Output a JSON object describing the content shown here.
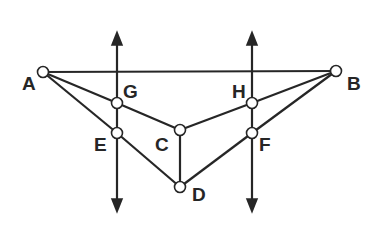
{
  "diagram": {
    "title": "",
    "colors": {
      "line": "#262626",
      "point_fill": "#ffffff",
      "background": "#ffffff"
    },
    "points": {
      "A": {
        "label": "A",
        "x": 43,
        "y": 72,
        "lx": 22,
        "ly": 90
      },
      "B": {
        "label": "B",
        "x": 336,
        "y": 71,
        "lx": 347,
        "ly": 90
      },
      "G": {
        "label": "G",
        "x": 117,
        "y": 103,
        "lx": 123,
        "ly": 98
      },
      "E": {
        "label": "E",
        "x": 117,
        "y": 133,
        "lx": 94,
        "ly": 151
      },
      "C": {
        "label": "C",
        "x": 180,
        "y": 130,
        "lx": 155,
        "ly": 151
      },
      "D": {
        "label": "D",
        "x": 180,
        "y": 187,
        "lx": 192,
        "ly": 201
      },
      "H": {
        "label": "H",
        "x": 252,
        "y": 103,
        "lx": 232,
        "ly": 98
      },
      "F": {
        "label": "F",
        "x": 252,
        "y": 133,
        "lx": 259,
        "ly": 151
      }
    },
    "segments": [
      [
        "A",
        "B"
      ],
      [
        "A",
        "G"
      ],
      [
        "G",
        "C"
      ],
      [
        "C",
        "H"
      ],
      [
        "H",
        "B"
      ],
      [
        "A",
        "E"
      ],
      [
        "E",
        "D"
      ],
      [
        "D",
        "F"
      ],
      [
        "F",
        "B"
      ],
      [
        "C",
        "D"
      ]
    ],
    "vertical_lines": [
      {
        "name": "line-through-G-E",
        "x": 117,
        "y_top": 32,
        "y_bottom": 212
      },
      {
        "name": "line-through-H-F",
        "x": 252,
        "y_top": 32,
        "y_bottom": 212
      }
    ]
  }
}
